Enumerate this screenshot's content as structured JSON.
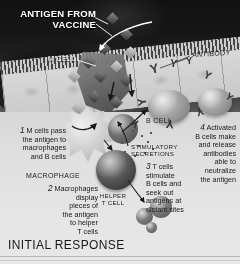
{
  "figure": {
    "title": "INITIAL RESPONSE",
    "labels": {
      "antigen_from_vaccine": "ANTIGEN FROM\nVACCINE",
      "m_cell": "M CELL",
      "macrophage": "MACROPHAGE",
      "helper_t_cell": "HELPER\nT CELL",
      "b_cell": "B CELL",
      "stimulatory_secretions": "STIMULATORY\nSECRETIONS",
      "antibody": "ANTIBODY"
    },
    "steps": [
      {
        "number": "1",
        "text": "M cells pass\nthe antigen to\nmacrophages\nand B cells",
        "align": "right"
      },
      {
        "number": "2",
        "text": "Macrophages\ndisplay\npieces of\nthe antigen\nto helper\nT cells",
        "align": "right"
      },
      {
        "number": "3",
        "text": "T cells\nstimulate\nB cells and\nseek out\nantigens at\ndistant sites",
        "align": "left"
      },
      {
        "number": "4",
        "text": "Activated\nB cells make\nand release\nantibodies\nable to\nneutralize\nthe antigen",
        "align": "right"
      }
    ],
    "colors": {
      "dark_field": "#1c1c1b",
      "light_field": "#e3dfd8",
      "text_dark": "#24221f",
      "text_light": "#ffffff",
      "cell_fill": "#a9a49b"
    }
  }
}
